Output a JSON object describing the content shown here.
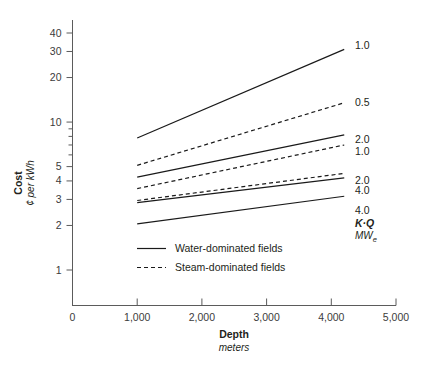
{
  "chart_data": {
    "type": "line",
    "title": "",
    "xlabel": "Depth",
    "xlabel_units": "meters",
    "ylabel": "Cost",
    "ylabel_units": "¢ per kWh",
    "xlim": [
      0,
      5000
    ],
    "ylim": [
      1,
      45
    ],
    "yscale": "log",
    "grid": false,
    "x_ticks": [
      {
        "value": 0,
        "label": "0"
      },
      {
        "value": 1000,
        "label": "1,000"
      },
      {
        "value": 2000,
        "label": "2,000"
      },
      {
        "value": 3000,
        "label": "3,000"
      },
      {
        "value": 4000,
        "label": "4,000"
      },
      {
        "value": 5000,
        "label": "5,000"
      }
    ],
    "y_ticks": [
      {
        "value": 1,
        "label": "1"
      },
      {
        "value": 2,
        "label": "2"
      },
      {
        "value": 3,
        "label": "3"
      },
      {
        "value": 4,
        "label": "4"
      },
      {
        "value": 5,
        "label": "5"
      },
      {
        "value": 6,
        "label": ""
      },
      {
        "value": 7,
        "label": ""
      },
      {
        "value": 8,
        "label": ""
      },
      {
        "value": 9,
        "label": ""
      },
      {
        "value": 10,
        "label": "10"
      },
      {
        "value": 20,
        "label": "20"
      },
      {
        "value": 30,
        "label": "30"
      },
      {
        "value": 40,
        "label": "40"
      }
    ],
    "series": [
      {
        "name": "water-1.0",
        "style": "solid",
        "legend_group": "Water-dominated fields",
        "label": "1.0",
        "x": [
          1000,
          4200
        ],
        "y": [
          7.8,
          31.0
        ]
      },
      {
        "name": "steam-0.5",
        "style": "dashed",
        "legend_group": "Steam-dominated fields",
        "label": "0.5",
        "x": [
          1000,
          4200
        ],
        "y": [
          5.1,
          13.5
        ]
      },
      {
        "name": "water-2.0",
        "style": "solid",
        "legend_group": "Water-dominated fields",
        "label": "2.0",
        "x": [
          1000,
          4200
        ],
        "y": [
          4.25,
          8.2
        ]
      },
      {
        "name": "steam-1.0",
        "style": "dashed",
        "legend_group": "Steam-dominated fields",
        "label": "1.0",
        "x": [
          1000,
          4200
        ],
        "y": [
          3.55,
          7.0
        ]
      },
      {
        "name": "steam-2.0",
        "style": "dashed",
        "legend_group": "Steam-dominated fields",
        "label": "2.0",
        "x": [
          1000,
          4200
        ],
        "y": [
          2.95,
          4.5
        ]
      },
      {
        "name": "water-4.0-upper",
        "style": "solid",
        "legend_group": "Water-dominated fields",
        "label": "4.0",
        "x": [
          1000,
          4200
        ],
        "y": [
          2.85,
          4.2
        ]
      },
      {
        "name": "water-4.0-lower",
        "style": "solid",
        "legend_group": "Water-dominated fields",
        "label": "4.0",
        "x": [
          1000,
          4200
        ],
        "y": [
          2.05,
          3.15
        ]
      }
    ],
    "series_labels": [
      {
        "label": "1.0",
        "x_px": 355,
        "y_px": 49
      },
      {
        "label": "0.5",
        "x_px": 355,
        "y_px": 106
      },
      {
        "label": "2.0",
        "x_px": 355,
        "y_px": 143
      },
      {
        "label": "1.0",
        "x_px": 355,
        "y_px": 155
      },
      {
        "label": "2.0",
        "x_px": 355,
        "y_px": 184
      },
      {
        "label": "4.0",
        "x_px": 355,
        "y_px": 194
      },
      {
        "label": "4.0",
        "x_px": 355,
        "y_px": 214
      }
    ],
    "unit_annotation": {
      "title": "K·Q",
      "subtitle": "MW",
      "subscript": "e"
    },
    "legend": {
      "position": "inside-bottom-left",
      "entries": [
        {
          "label": "Water-dominated fields",
          "style": "solid"
        },
        {
          "label": "Steam-dominated fields",
          "style": "dashed"
        }
      ]
    }
  }
}
